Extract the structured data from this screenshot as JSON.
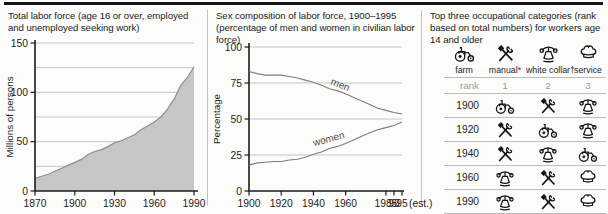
{
  "chart_data": [
    {
      "type": "area",
      "title": "Total labor force (age 16 or over, employed and unemployed seeking work)",
      "ylabel": "Millions of persons",
      "xlim": [
        1870,
        1990
      ],
      "ylim": [
        0,
        150
      ],
      "x_ticks": [
        1870,
        1900,
        1930,
        1960,
        1990
      ],
      "y_tick_labels": [
        0,
        50,
        100,
        150
      ],
      "gridlines_y": [
        25,
        50,
        75,
        100,
        125,
        150
      ],
      "x": [
        1870,
        1880,
        1890,
        1900,
        1905,
        1910,
        1915,
        1920,
        1925,
        1930,
        1935,
        1940,
        1945,
        1950,
        1955,
        1960,
        1965,
        1970,
        1975,
        1980,
        1985,
        1990
      ],
      "values": [
        13,
        17,
        23,
        29,
        32,
        37,
        40,
        42,
        45,
        49,
        51,
        54,
        57,
        62,
        66,
        70,
        75,
        83,
        93,
        107,
        115,
        126
      ],
      "fill_color": "#c6c6c6",
      "line_color": "#8e8e8e",
      "grid_color": "#b6b6b6",
      "axis_color": "#1a1a1a"
    },
    {
      "type": "line",
      "title": "Sex composition of labor force, 1900–1995 (percentage of men and women in civilian labor force)",
      "ylabel": "Percentage",
      "xlim": [
        1900,
        1995
      ],
      "ylim": [
        0,
        100
      ],
      "x_ticks": [
        1900,
        1920,
        1940,
        1960,
        1985,
        1990,
        1995
      ],
      "x_tick_labels": [
        "1900",
        "1920",
        "1940",
        "1960",
        "1985",
        "90",
        "95"
      ],
      "x_axis_suffix": "(est.)",
      "y_tick_labels": [
        0,
        25,
        50,
        75,
        100
      ],
      "gridlines_y": [
        25,
        50,
        75,
        100
      ],
      "x": [
        1900,
        1905,
        1910,
        1915,
        1920,
        1925,
        1930,
        1935,
        1940,
        1945,
        1950,
        1955,
        1960,
        1965,
        1970,
        1975,
        1980,
        1985,
        1990,
        1995
      ],
      "series": [
        {
          "name": "men",
          "values": [
            83,
            81.5,
            80.5,
            80.5,
            80.5,
            79.5,
            78.5,
            77,
            75.5,
            73.5,
            71,
            69.5,
            67.5,
            65,
            62.5,
            60,
            57.5,
            56,
            54.5,
            53.5
          ]
        },
        {
          "name": "women",
          "values": [
            18,
            19.5,
            20,
            20.5,
            20.5,
            21.5,
            22,
            23.5,
            25.5,
            27,
            29.5,
            31,
            33,
            35.5,
            38,
            40.5,
            42.5,
            44,
            45.5,
            48
          ]
        }
      ],
      "line_color": "#7d7d7d",
      "grid_color": "#b6b6b6",
      "axis_color": "#1a1a1a"
    },
    {
      "type": "table",
      "title": "Top three occupational categories (rank based on total numbers) for workers age 14 and older",
      "columns": [
        "rank",
        "1",
        "2",
        "3"
      ],
      "rows": [
        {
          "year": "1900",
          "ranks": [
            "farm",
            "manual",
            "white collar"
          ]
        },
        {
          "year": "1920",
          "ranks": [
            "manual",
            "farm",
            "white collar"
          ]
        },
        {
          "year": "1940",
          "ranks": [
            "manual",
            "white collar",
            "farm"
          ]
        },
        {
          "year": "1960",
          "ranks": [
            "white collar",
            "manual",
            "service"
          ]
        },
        {
          "year": "1990",
          "ranks": [
            "white collar",
            "manual",
            "service"
          ]
        }
      ]
    }
  ],
  "occupations": {
    "title": "Top three occupational categories (rank based on total numbers) for workers age 14 and older",
    "categories": {
      "farm": {
        "label": "farm",
        "icon": "tractor-icon"
      },
      "manual": {
        "label": "manual*",
        "icon": "crossed-tools-icon"
      },
      "white_collar": {
        "label": "white collar†",
        "icon": "telephone-icon"
      },
      "service": {
        "label": "service",
        "icon": "chef-hat-icon"
      }
    },
    "legend_order": [
      "farm",
      "manual",
      "white_collar",
      "service"
    ],
    "rank_label": "rank",
    "rank_numbers": [
      "1",
      "2",
      "3"
    ],
    "rows": [
      {
        "year": "1900",
        "ranks": [
          "farm",
          "manual",
          "white_collar"
        ]
      },
      {
        "year": "1920",
        "ranks": [
          "manual",
          "farm",
          "white_collar"
        ]
      },
      {
        "year": "1940",
        "ranks": [
          "manual",
          "white_collar",
          "farm"
        ]
      },
      {
        "year": "1960",
        "ranks": [
          "white_collar",
          "manual",
          "service"
        ]
      },
      {
        "year": "1990",
        "ranks": [
          "white_collar",
          "manual",
          "service"
        ]
      }
    ]
  }
}
